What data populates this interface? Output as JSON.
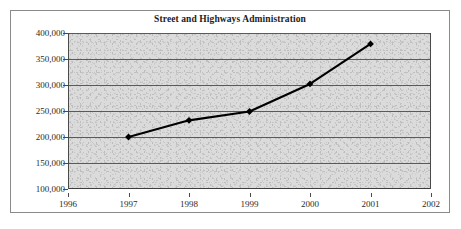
{
  "chart_data": {
    "type": "line",
    "title": "Street and Highways Administration",
    "xlabel": "",
    "ylabel": "",
    "x": [
      1997,
      1998,
      1999,
      2000,
      2001
    ],
    "values": [
      200000,
      232000,
      249000,
      302000,
      379000
    ],
    "series": [
      {
        "name": "Street and Highways Administration",
        "values": [
          200000,
          232000,
          249000,
          302000,
          379000
        ],
        "color": "#000000",
        "marker": "diamond"
      }
    ],
    "xlim": [
      1996,
      2002
    ],
    "ylim": [
      100000,
      400000
    ],
    "x_tick_labels": [
      "1996",
      "1997",
      "1998",
      "1999",
      "2000",
      "2001",
      "2002"
    ],
    "x_tick_values": [
      1996,
      1997,
      1998,
      1999,
      2000,
      2001,
      2002
    ],
    "y_tick_labels": [
      "400,000",
      "350,000",
      "300,000",
      "250,000",
      "200,000",
      "150,000",
      "100,000"
    ],
    "y_tick_values": [
      400000,
      350000,
      300000,
      250000,
      200000,
      150000,
      100000
    ],
    "grid": true,
    "grid_axis": "y",
    "legend": null,
    "plot_background": "#dcdcdc",
    "frame_border_color": "#8a8a8a"
  }
}
